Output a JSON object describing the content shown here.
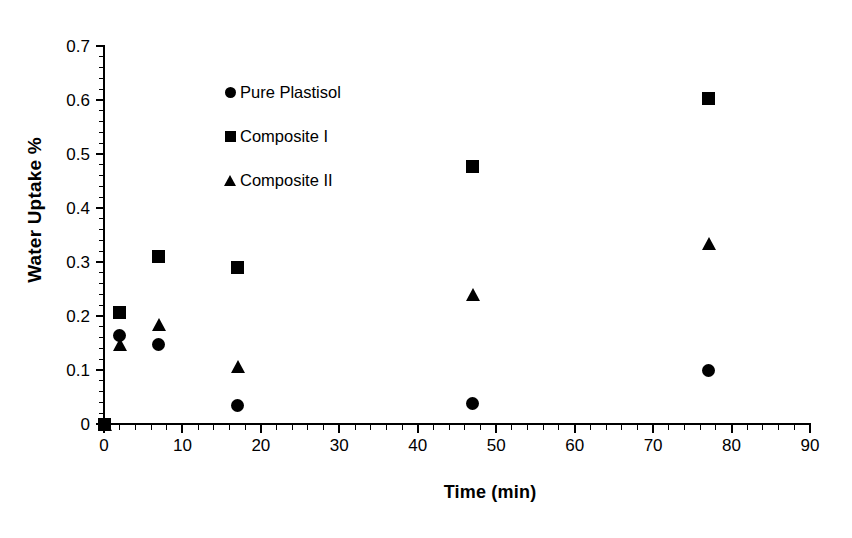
{
  "chart_data": {
    "type": "scatter",
    "title": "",
    "xlabel": "Time (min)",
    "ylabel": "Water Uptake %",
    "xlim": [
      0,
      90
    ],
    "ylim": [
      0,
      0.7
    ],
    "grid": false,
    "legend_position": "upper-left-inside",
    "x_ticks": [
      "0",
      "10",
      "20",
      "30",
      "40",
      "50",
      "60",
      "70",
      "80",
      "90"
    ],
    "x_tick_values": [
      0,
      10,
      20,
      30,
      40,
      50,
      60,
      70,
      80,
      90
    ],
    "x_minor_tick_interval": 2,
    "y_ticks": [
      "0",
      "0.1",
      "0.2",
      "0.3",
      "0.4",
      "0.5",
      "0.6",
      "0.7"
    ],
    "y_tick_values": [
      0,
      0.1,
      0.2,
      0.3,
      0.4,
      0.5,
      0.6,
      0.7
    ],
    "y_minor_tick_interval": 0.02,
    "series": [
      {
        "name": "Pure Plastisol",
        "marker": "circle",
        "color": "#000000",
        "x": [
          0,
          2,
          7,
          17,
          47,
          77
        ],
        "y": [
          0.0,
          0.163,
          0.148,
          0.034,
          0.038,
          0.1
        ]
      },
      {
        "name": "Composite I",
        "marker": "square",
        "color": "#000000",
        "x": [
          0,
          2,
          7,
          17,
          47,
          77
        ],
        "y": [
          0.0,
          0.207,
          0.31,
          0.29,
          0.477,
          0.602
        ]
      },
      {
        "name": "Composite II",
        "marker": "triangle",
        "color": "#000000",
        "x": [
          0,
          2,
          7,
          17,
          47,
          77
        ],
        "y": [
          0.0,
          0.148,
          0.185,
          0.107,
          0.239,
          0.335
        ]
      }
    ]
  },
  "plot_geometry": {
    "origin_x_px": 104,
    "origin_y_px": 424,
    "px_per_x_unit": 7.8444,
    "px_per_y_unit": 540
  }
}
